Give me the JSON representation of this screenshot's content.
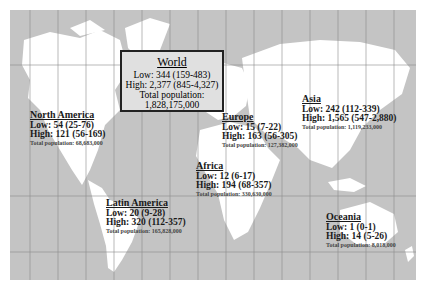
{
  "map": {
    "background_color": "#c4c4c4",
    "land_color": "#ffffff",
    "grid_color": "#8a8a8a"
  },
  "world": {
    "title": "World",
    "low": "Low: 344 (159-483)",
    "high": "High: 2,377 (845-4,327)",
    "pop_label": "Total population:",
    "pop_value": "1,828,175,000"
  },
  "regions": [
    {
      "name": "North America",
      "low": "Low: 54 (25-76)",
      "high": "High: 121 (56-169)",
      "pop": "Total population: 68,683,000"
    },
    {
      "name": "Europe",
      "low": "Low: 15 (7-22)",
      "high": "High: 163 (56-305)",
      "pop": "Total population: 127,382,000"
    },
    {
      "name": "Asia",
      "low": "Low: 242 (112-339)",
      "high": "High: 1,565 (547-2,880)",
      "pop": "Total population: 1,119,233,000"
    },
    {
      "name": "Africa",
      "low": "Low: 12 (6-17)",
      "high": "High: 194 (68-357)",
      "pop": "Total population: 330,630,000"
    },
    {
      "name": "Latin America",
      "low": "Low: 20 (9-28)",
      "high": "High: 320 (112-357)",
      "pop": "Total population: 165,828,000"
    },
    {
      "name": "Oceania",
      "low": "Low: 1 (0-1)",
      "high": "High: 14 (5-26)",
      "pop": "Total population: 8,018,000"
    }
  ]
}
